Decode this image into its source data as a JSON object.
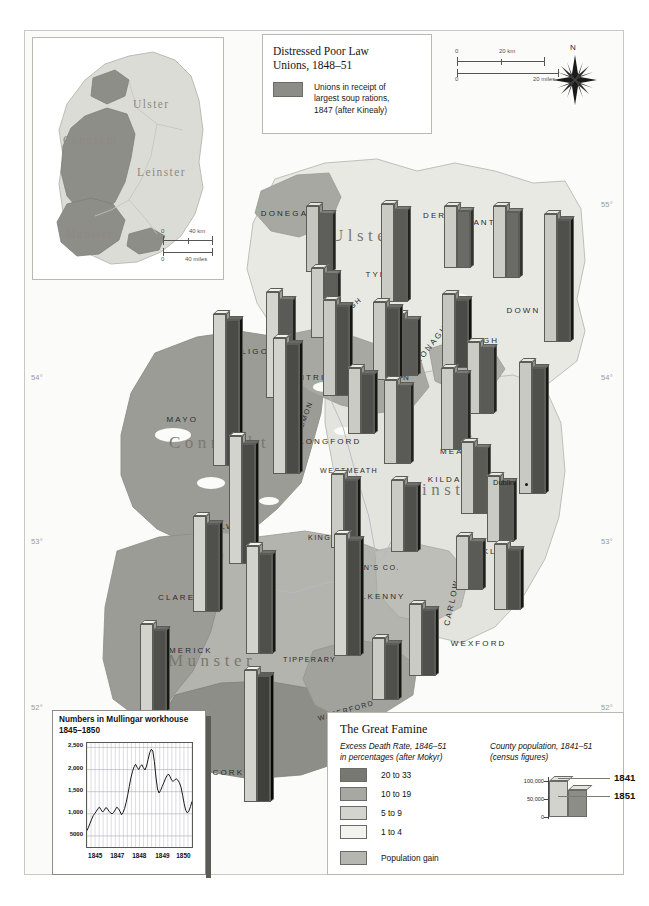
{
  "figure": {
    "kind": "historical-thematic-map"
  },
  "graticule": {
    "lat_labels_left": [
      "54",
      "53",
      "52"
    ],
    "lat_labels_right": [
      "55",
      "54",
      "53",
      "52"
    ],
    "lon_labels": [
      "7",
      "9"
    ],
    "degree_symbol": "°"
  },
  "inset_provinces": {
    "labels": [
      "Ulster",
      "Connacht",
      "Leinster",
      "Munster"
    ],
    "scale": {
      "km": {
        "zero": "0",
        "max": "40 km"
      },
      "miles": {
        "zero": "0",
        "max": "40 miles"
      }
    }
  },
  "legend_top": {
    "title_line1": "Distressed Poor Law",
    "title_line2": "Unions, 1848–51",
    "swatch_color": "#8d8d87",
    "description_line1": "Unions in receipt of",
    "description_line2": "largest soup rations,",
    "description_line3": "1847 (after Kinealy)"
  },
  "scalebar": {
    "km_zero": "0",
    "km_max": "20 km",
    "miles_zero": "0",
    "miles_max": "20 miles"
  },
  "compass": {
    "north_label": "N"
  },
  "counties": [
    {
      "name": "DONEGAL",
      "x": 285,
      "y": 213
    },
    {
      "name": "DERRY",
      "x": 440,
      "y": 215
    },
    {
      "name": "ANTRIM",
      "x": 494,
      "y": 222
    },
    {
      "name": "TYRONE",
      "x": 386,
      "y": 274
    },
    {
      "name": "DOWN",
      "x": 520,
      "y": 310
    },
    {
      "name": "FERMANAGH",
      "x": 336,
      "y": 317
    },
    {
      "name": "MONAGHAN",
      "x": 432,
      "y": 338
    },
    {
      "name": "ARMAGH",
      "x": 472,
      "y": 340
    },
    {
      "name": "SLIGO",
      "x": 251,
      "y": 351
    },
    {
      "name": "LEITRIM",
      "x": 312,
      "y": 377
    },
    {
      "name": "CAVAN",
      "x": 391,
      "y": 377
    },
    {
      "name": "LOUTH",
      "x": 466,
      "y": 402
    },
    {
      "name": "MAYO",
      "x": 180,
      "y": 419
    },
    {
      "name": "ROSCOMMON",
      "x": 296,
      "y": 430
    },
    {
      "name": "LONGFORD",
      "x": 327,
      "y": 441
    },
    {
      "name": "MEATH",
      "x": 457,
      "y": 451
    },
    {
      "name": "WESTMEATH",
      "x": 347,
      "y": 470
    },
    {
      "name": "KILDARE",
      "x": 452,
      "y": 479
    },
    {
      "name": "DUBLIN",
      "x": 492,
      "y": 493
    },
    {
      "name": "GALWAY",
      "x": 225,
      "y": 526
    },
    {
      "name": "KING'S CO.",
      "x": 338,
      "y": 537
    },
    {
      "name": "WICKLOW",
      "x": 485,
      "y": 551
    },
    {
      "name": "QUEEN'S CO.",
      "x": 371,
      "y": 567
    },
    {
      "name": "CLARE",
      "x": 175,
      "y": 597
    },
    {
      "name": "KILKENNY",
      "x": 377,
      "y": 596
    },
    {
      "name": "CARLOW",
      "x": 449,
      "y": 602
    },
    {
      "name": "WEXFORD",
      "x": 475,
      "y": 643
    },
    {
      "name": "LIMERICK",
      "x": 186,
      "y": 650
    },
    {
      "name": "TIPPERARY",
      "x": 310,
      "y": 659
    },
    {
      "name": "WATERFORD",
      "x": 344,
      "y": 710
    },
    {
      "name": "KERRY",
      "x": 132,
      "y": 717
    },
    {
      "name": "CORK",
      "x": 226,
      "y": 772
    }
  ],
  "provinces_main": [
    {
      "name": "Ulster",
      "x": 330,
      "y": 233
    },
    {
      "name": "Connacht",
      "x": 168,
      "y": 440
    },
    {
      "name": "Leinster",
      "x": 394,
      "y": 487
    },
    {
      "name": "Munster",
      "x": 167,
      "y": 658
    }
  ],
  "places": [
    {
      "name": "Dublin",
      "label_x": 492,
      "label_y": 477,
      "dot_x": 524,
      "dot_y": 482
    }
  ],
  "bar_pairs": [
    {
      "county": "DONEGAL",
      "x": 305,
      "y": 200,
      "h1841": 66,
      "h1851": 58,
      "c1841": "#c6c6c1",
      "c1851": "#5e5e5a"
    },
    {
      "county": "DERRY",
      "x": 443,
      "y": 200,
      "h1841": 62,
      "h1851": 57,
      "c1841": "#cdcdc8",
      "c1851": "#6a6a66"
    },
    {
      "county": "ANTRIM",
      "x": 492,
      "y": 200,
      "h1841": 72,
      "h1851": 66,
      "c1841": "#cdcdc8",
      "c1851": "#6a6a66"
    },
    {
      "county": "DOWN",
      "x": 543,
      "y": 208,
      "h1841": 128,
      "h1851": 122,
      "c1841": "#c9c9c4",
      "c1851": "#4f4f4c"
    },
    {
      "county": "TYRONE",
      "x": 380,
      "y": 198,
      "h1841": 98,
      "h1851": 92,
      "c1841": "#cbcbc6",
      "c1851": "#5a5a56"
    },
    {
      "county": "FERMANAGH",
      "x": 310,
      "y": 262,
      "h1841": 70,
      "h1851": 64,
      "c1841": "#cbcbc6",
      "c1851": "#5e5e5a"
    },
    {
      "county": "MONAGHAN",
      "x": 390,
      "y": 308,
      "h1841": 62,
      "h1851": 56,
      "c1841": "#cbcbc6",
      "c1851": "#5a5a56"
    },
    {
      "county": "ARMAGH",
      "x": 441,
      "y": 288,
      "h1841": 74,
      "h1851": 68,
      "c1841": "#c6c6c1",
      "c1851": "#4a4a47"
    },
    {
      "county": "SLIGO",
      "x": 265,
      "y": 286,
      "h1841": 106,
      "h1851": 98,
      "c1841": "#d5d5d0",
      "c1851": "#5a5a56"
    },
    {
      "county": "LEITRIM",
      "x": 322,
      "y": 294,
      "h1841": 96,
      "h1851": 90,
      "c1841": "#c9c9c4",
      "c1851": "#4f4f4c"
    },
    {
      "county": "CAVAN",
      "x": 372,
      "y": 296,
      "h1841": 78,
      "h1851": 72,
      "c1841": "#c9c9c4",
      "c1851": "#4f4f4c"
    },
    {
      "county": "LOUTH",
      "x": 466,
      "y": 336,
      "h1841": 72,
      "h1851": 66,
      "c1841": "#cbcbc6",
      "c1851": "#5a5a56"
    },
    {
      "county": "MAYO",
      "x": 212,
      "y": 308,
      "h1841": 152,
      "h1851": 146,
      "c1841": "#d3d3ce",
      "c1851": "#4a4a47"
    },
    {
      "county": "ROSCOMMON",
      "x": 272,
      "y": 332,
      "h1841": 136,
      "h1851": 130,
      "c1841": "#d3d3ce",
      "c1851": "#4a4a47"
    },
    {
      "county": "LONGFORD",
      "x": 347,
      "y": 362,
      "h1841": 66,
      "h1851": 60,
      "c1841": "#cbcbc6",
      "c1851": "#4f4f4c"
    },
    {
      "county": "WESTMEATH",
      "x": 383,
      "y": 374,
      "h1841": 84,
      "h1851": 78,
      "c1841": "#cbcbc6",
      "c1851": "#5a5a56"
    },
    {
      "county": "MEATH",
      "x": 440,
      "y": 362,
      "h1841": 82,
      "h1851": 76,
      "c1841": "#cbcbc6",
      "c1851": "#5a5a56"
    },
    {
      "county": "DUBLIN",
      "x": 518,
      "y": 356,
      "h1841": 132,
      "h1851": 126,
      "c1841": "#c9c9c4",
      "c1851": "#4f4f4c"
    },
    {
      "county": "GALWAY",
      "x": 228,
      "y": 430,
      "h1841": 128,
      "h1851": 120,
      "c1841": "#d3d3ce",
      "c1851": "#4a4a47"
    },
    {
      "county": "KILDARE",
      "x": 460,
      "y": 436,
      "h1841": 72,
      "h1851": 66,
      "c1841": "#cbcbc6",
      "c1851": "#5a5a56"
    },
    {
      "county": "KING'S CO.",
      "x": 330,
      "y": 468,
      "h1841": 74,
      "h1851": 68,
      "c1841": "#cbcbc6",
      "c1851": "#4f4f4c"
    },
    {
      "county": "QUEEN'S CO.",
      "x": 390,
      "y": 474,
      "h1841": 72,
      "h1851": 66,
      "c1841": "#cbcbc6",
      "c1851": "#4f4f4c"
    },
    {
      "county": "WICKLOW",
      "x": 486,
      "y": 470,
      "h1841": 66,
      "h1851": 60,
      "c1841": "#cbcbc6",
      "c1851": "#5a5a56"
    },
    {
      "county": "CLARE",
      "x": 192,
      "y": 510,
      "h1841": 96,
      "h1851": 88,
      "c1841": "#d3d3ce",
      "c1851": "#4f4f4c"
    },
    {
      "county": "CARLOW",
      "x": 455,
      "y": 530,
      "h1841": 54,
      "h1851": 48,
      "c1841": "#cbcbc6",
      "c1851": "#5a5a56"
    },
    {
      "county": "WEXFORD",
      "x": 493,
      "y": 538,
      "h1841": 66,
      "h1851": 60,
      "c1841": "#cbcbc6",
      "c1851": "#4f4f4c"
    },
    {
      "county": "LIMERICK",
      "x": 245,
      "y": 540,
      "h1841": 108,
      "h1851": 100,
      "c1841": "#d3d3ce",
      "c1851": "#4f4f4c"
    },
    {
      "county": "TIPPERARY",
      "x": 333,
      "y": 528,
      "h1841": 122,
      "h1851": 116,
      "c1841": "#d3d3ce",
      "c1851": "#4a4a47"
    },
    {
      "county": "KILKENNY",
      "x": 408,
      "y": 598,
      "h1841": 72,
      "h1851": 66,
      "c1841": "#cbcbc6",
      "c1851": "#4f4f4c"
    },
    {
      "county": "WATERFORD",
      "x": 371,
      "y": 632,
      "h1841": 62,
      "h1851": 56,
      "c1841": "#cbcbc6",
      "c1851": "#4f4f4c"
    },
    {
      "county": "KERRY",
      "x": 139,
      "y": 618,
      "h1841": 88,
      "h1851": 82,
      "c1841": "#d3d3ce",
      "c1851": "#4f4f4c"
    },
    {
      "county": "CORK",
      "x": 243,
      "y": 664,
      "h1841": 132,
      "h1851": 126,
      "c1841": "#d3d3ce",
      "c1851": "#3f3f3c"
    }
  ],
  "chart_mullingar": {
    "type": "line",
    "title_line1": "Numbers in Mullingar workhouse",
    "title_line2": "1845–1850",
    "ylabel": "",
    "xlabel": "",
    "ytick_labels": [
      "2,500",
      "2,000",
      "1,500",
      "1,000",
      "5000"
    ],
    "ytick_values": [
      2500,
      2000,
      1500,
      1000,
      500
    ],
    "ylim": [
      250,
      2600
    ],
    "xtick_labels": [
      "1845",
      "1847",
      "1848",
      "1849",
      "1850"
    ],
    "grid": true,
    "values": [
      620,
      700,
      790,
      880,
      960,
      1010,
      1060,
      1120,
      1150,
      1090,
      1040,
      1080,
      1140,
      1120,
      1060,
      1020,
      1000,
      1030,
      1090,
      1150,
      1120,
      1060,
      980,
      1030,
      1120,
      1260,
      1430,
      1620,
      1810,
      1950,
      2060,
      2120,
      2050,
      2000,
      2070,
      2110,
      2040,
      1990,
      2080,
      2230,
      2380,
      2460,
      2420,
      2180,
      1830,
      1560,
      1470,
      1530,
      1620,
      1700,
      1790,
      1860,
      1900,
      1840,
      1760,
      1730,
      1770,
      1790,
      1760,
      1700,
      1600,
      1420,
      1230,
      1080,
      1020,
      1060,
      1160,
      1280
    ]
  },
  "legend_bottom": {
    "title": "The Great Famine",
    "death_rate": {
      "heading_line1": "Excess Death Rate, 1846–51",
      "heading_line2": "in percentages (after Mokyr)",
      "classes": [
        {
          "label": "20 to 33",
          "color": "#787872"
        },
        {
          "label": "10 to 19",
          "color": "#a8a8a2"
        },
        {
          "label": "5 to 9",
          "color": "#d4d4cf"
        },
        {
          "label": "1 to 4",
          "color": "#f2f2ee"
        }
      ],
      "gain": {
        "label": "Population gain",
        "color": "#b6b6b0"
      }
    },
    "population": {
      "heading_line1": "County population, 1841–51",
      "heading_line2": "(census figures)",
      "ytick_labels": [
        "100,000",
        "50,000",
        "0"
      ],
      "bars": [
        {
          "year_label": "1841",
          "color": "#d3d3ce"
        },
        {
          "year_label": "1851",
          "color": "#8d8d87"
        }
      ]
    }
  }
}
